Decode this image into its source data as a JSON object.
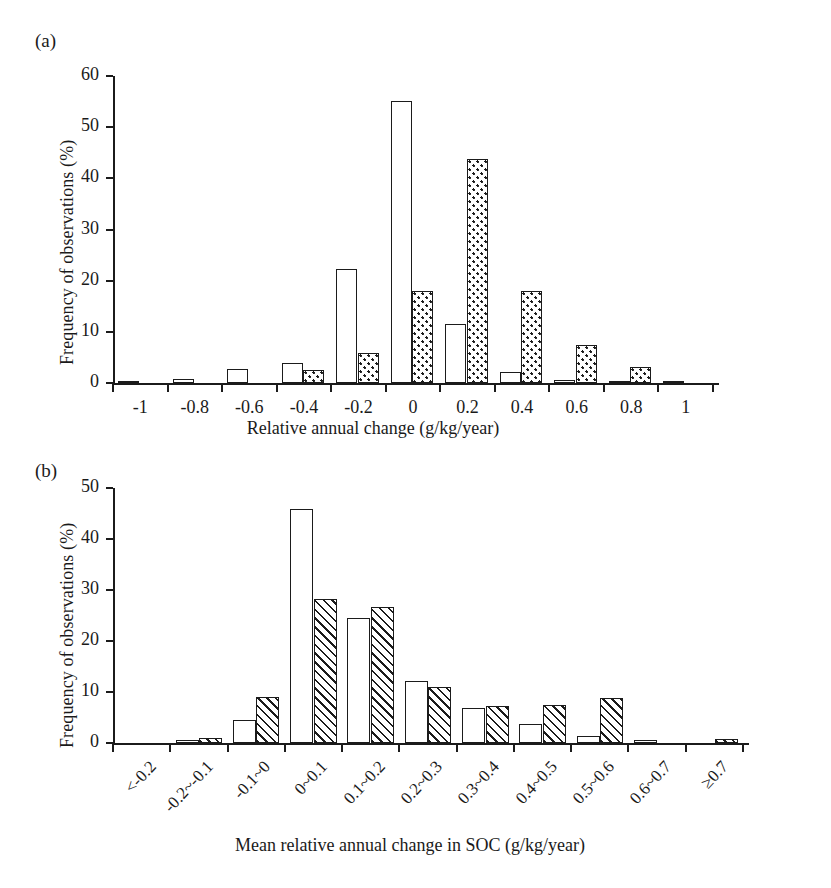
{
  "figure": {
    "panels": [
      {
        "letter": "(a)",
        "ylabel": "Frequency of observations (%)",
        "xlabel": "Relative annual change (g/kg/year)"
      },
      {
        "letter": "(b)",
        "ylabel": "Frequency of observations (%)",
        "xlabel": "Mean relative annual change in SOC (g/kg/year)"
      }
    ]
  },
  "chart_data": [
    {
      "type": "bar",
      "panel": "(a)",
      "title": "",
      "xlabel": "Relative annual change (g/kg/year)",
      "ylabel": "Frequency of observations (%)",
      "ylim": [
        0,
        60
      ],
      "yticks": [
        0,
        10,
        20,
        30,
        40,
        50,
        60
      ],
      "xticks": [
        "-1",
        "-0.8",
        "-0.6",
        "-0.4",
        "-0.2",
        "0",
        "0.2",
        "0.4",
        "0.6",
        "0.8",
        "1"
      ],
      "categories": [
        "-1",
        "-0.8",
        "-0.6",
        "-0.4",
        "-0.2",
        "0",
        "0.2",
        "0.4",
        "0.6",
        "0.8",
        "1"
      ],
      "grid": false,
      "legend": "none",
      "series": [
        {
          "name": "open",
          "fill": "white",
          "values": [
            0.4,
            0.8,
            2.7,
            3.9,
            22.3,
            55.2,
            11.6,
            2.2,
            0.6,
            0.3,
            0.2
          ]
        },
        {
          "name": "dotted",
          "fill": "stipple",
          "values": [
            0.0,
            0.0,
            0.0,
            2.6,
            5.9,
            18.0,
            43.8,
            18.0,
            7.4,
            3.1,
            0.0
          ]
        }
      ]
    },
    {
      "type": "bar",
      "panel": "(b)",
      "title": "",
      "xlabel": "Mean relative annual change in SOC (g/kg/year)",
      "ylabel": "Frequency of observations (%)",
      "ylim": [
        0,
        50
      ],
      "yticks": [
        0,
        10,
        20,
        30,
        40,
        50
      ],
      "xticks": [
        "<-0.2",
        "-0.2~-0.1",
        "-0.1~0",
        "0~0.1",
        "0.1~0.2",
        "0.2~0.3",
        "0.3~0.4",
        "0.4~0.5",
        "0.5~0.6",
        "0.6~0.7",
        "≥0.7"
      ],
      "categories": [
        "<-0.2",
        "-0.2~-0.1",
        "-0.1~0",
        "0~0.1",
        "0.1~0.2",
        "0.2~0.3",
        "0.3~0.4",
        "0.4~0.5",
        "0.5~0.6",
        "0.6~0.7",
        "≥0.7"
      ],
      "grid": false,
      "legend": "none",
      "series": [
        {
          "name": "open",
          "fill": "white",
          "values": [
            0.0,
            0.6,
            4.5,
            45.8,
            24.6,
            12.2,
            6.9,
            3.7,
            1.3,
            0.5,
            0.0
          ]
        },
        {
          "name": "hatched",
          "fill": "diagonal-hatch",
          "values": [
            0.0,
            0.9,
            9.0,
            28.2,
            26.7,
            11.0,
            7.3,
            7.5,
            8.9,
            0.0,
            0.7
          ]
        }
      ]
    }
  ]
}
